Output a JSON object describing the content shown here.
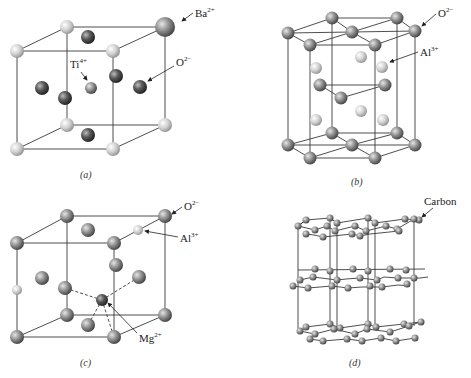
{
  "figure": {
    "panels": [
      {
        "id": "a",
        "caption": "(a)",
        "title": "Perovskite (BaTiO3) unit cell",
        "labels": [
          {
            "base": "Ba",
            "charge": "2+"
          },
          {
            "base": "Ti",
            "charge": "4+"
          },
          {
            "base": "O",
            "charge": "2−"
          }
        ]
      },
      {
        "id": "b",
        "caption": "(b)",
        "title": "Corundum (Al2O3) hexagonal structure",
        "labels": [
          {
            "base": "O",
            "charge": "2−"
          },
          {
            "base": "Al",
            "charge": "3+"
          }
        ]
      },
      {
        "id": "c",
        "caption": "(c)",
        "title": "Spinel (MgAl2O4) structure",
        "labels": [
          {
            "base": "O",
            "charge": "2−"
          },
          {
            "base": "Al",
            "charge": "3+"
          },
          {
            "base": "Mg",
            "charge": "2+"
          }
        ]
      },
      {
        "id": "d",
        "caption": "(d)",
        "title": "Graphite layered structure",
        "labels": [
          {
            "base": "Carbon",
            "charge": ""
          }
        ]
      }
    ],
    "colors": {
      "light_atom": "#c8c8c8",
      "medium_atom": "#8a8a8a",
      "dark_atom": "#4a4a4a",
      "line": "#3a3a3a"
    }
  }
}
